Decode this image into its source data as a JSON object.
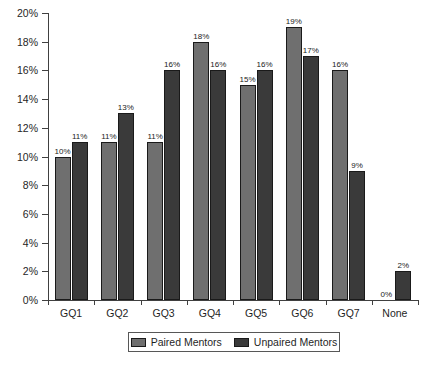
{
  "chart_data": {
    "type": "bar",
    "title": "",
    "subtitle": "",
    "xlabel": "",
    "ylabel": "",
    "categories": [
      "GQ1",
      "GQ2",
      "GQ3",
      "GQ4",
      "GQ5",
      "GQ6",
      "GQ7",
      "None"
    ],
    "series": [
      {
        "name": "Paired Mentors",
        "color": "#6f6f6f",
        "values": [
          10,
          11,
          11,
          18,
          15,
          19,
          16,
          0
        ],
        "labels": [
          "10%",
          "11%",
          "11%",
          "18%",
          "15%",
          "19%",
          "16%",
          "0%"
        ]
      },
      {
        "name": "Unpaired Mentors",
        "color": "#3a3a3a",
        "values": [
          11,
          13,
          16,
          16,
          16,
          17,
          9,
          2
        ],
        "labels": [
          "11%",
          "13%",
          "16%",
          "16%",
          "16%",
          "17%",
          "9%",
          "2%"
        ]
      }
    ],
    "ylim": [
      0,
      20
    ],
    "ytick_values": [
      0,
      2,
      4,
      6,
      8,
      10,
      12,
      14,
      16,
      18,
      20
    ],
    "ytick_labels": [
      "0%",
      "2%",
      "4%",
      "6%",
      "8%",
      "10%",
      "12%",
      "14%",
      "16%",
      "18%",
      "20%"
    ],
    "grid": false,
    "legend_position": "bottom-center"
  },
  "legend": {
    "entries": [
      {
        "label": "Paired Mentors"
      },
      {
        "label": "Unpaired Mentors"
      }
    ]
  }
}
